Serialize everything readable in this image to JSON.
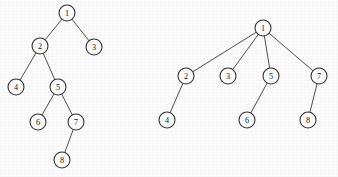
{
  "figure": {
    "background_color": "#fbfbfb",
    "node_fill": "#fcfcfc",
    "node_stroke": "#2c2c2c",
    "edge_color": "#3a3a3a",
    "node_radius": 8
  },
  "diagrams": [
    {
      "id": "left-tree",
      "name": "binary-tree",
      "nodes": [
        {
          "label": "1",
          "x": 67,
          "y": 13
        },
        {
          "label": "2",
          "x": 40,
          "y": 46
        },
        {
          "label": "3",
          "x": 94,
          "y": 47
        },
        {
          "label": "4",
          "x": 16,
          "y": 87
        },
        {
          "label": "5",
          "x": 58,
          "y": 87
        },
        {
          "label": "6",
          "x": 38,
          "y": 122
        },
        {
          "label": "7",
          "x": 76,
          "y": 122
        },
        {
          "label": "8",
          "x": 62,
          "y": 160
        }
      ],
      "edges": [
        {
          "from": "1",
          "to": "2"
        },
        {
          "from": "1",
          "to": "3"
        },
        {
          "from": "2",
          "to": "4"
        },
        {
          "from": "2",
          "to": "5"
        },
        {
          "from": "5",
          "to": "6"
        },
        {
          "from": "5",
          "to": "7"
        },
        {
          "from": "7",
          "to": "8"
        }
      ]
    },
    {
      "id": "right-tree",
      "name": "general-tree",
      "nodes": [
        {
          "label": "1",
          "x": 263,
          "y": 28
        },
        {
          "label": "2",
          "x": 186,
          "y": 76
        },
        {
          "label": "3",
          "x": 228,
          "y": 76
        },
        {
          "label": "5",
          "x": 271,
          "y": 76
        },
        {
          "label": "7",
          "x": 319,
          "y": 76
        },
        {
          "label": "4",
          "x": 167,
          "y": 120
        },
        {
          "label": "6",
          "x": 247,
          "y": 120
        },
        {
          "label": "8",
          "x": 308,
          "y": 120
        }
      ],
      "edges": [
        {
          "from": "1",
          "to": "2"
        },
        {
          "from": "1",
          "to": "3"
        },
        {
          "from": "1",
          "to": "5"
        },
        {
          "from": "1",
          "to": "7"
        },
        {
          "from": "2",
          "to": "4"
        },
        {
          "from": "5",
          "to": "6"
        },
        {
          "from": "7",
          "to": "8"
        }
      ]
    }
  ]
}
